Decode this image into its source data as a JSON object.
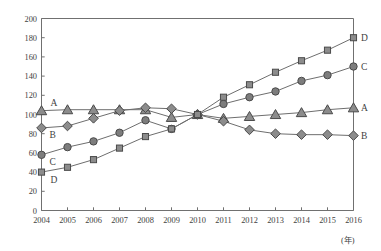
{
  "chart_data": {
    "type": "line",
    "title": "",
    "subtitle": "",
    "xlabel": "(年)",
    "ylabel": "",
    "x": [
      2004,
      2005,
      2006,
      2007,
      2008,
      2009,
      2010,
      2011,
      2012,
      2013,
      2014,
      2015,
      2016
    ],
    "categories": [
      "2004",
      "2005",
      "2006",
      "2007",
      "2008",
      "2009",
      "2010",
      "2011",
      "2012",
      "2013",
      "2014",
      "2015",
      "2016"
    ],
    "xlim": [
      2004,
      2016
    ],
    "ylim": [
      0,
      200
    ],
    "yticks": [
      0,
      20,
      40,
      60,
      80,
      100,
      120,
      140,
      160,
      180,
      200
    ],
    "xticks": [
      "2004",
      "2005",
      "2006",
      "2007",
      "2008",
      "2009",
      "2010",
      "2011",
      "2012",
      "2013",
      "2014",
      "2015",
      "2016"
    ],
    "grid": false,
    "legend_position": "inline-endpoints",
    "series": [
      {
        "name": "A",
        "marker": "triangle",
        "color": "#8c8c8c",
        "line_color": "#6e6e6e",
        "values": [
          104,
          105,
          105,
          105,
          105,
          97,
          100,
          96,
          98,
          100,
          102,
          105,
          107
        ],
        "label_start": "A",
        "label_end": "A"
      },
      {
        "name": "B",
        "marker": "diamond",
        "color": "#8c8c8c",
        "line_color": "#6e6e6e",
        "values": [
          86,
          88,
          96,
          104,
          107,
          106,
          100,
          93,
          84,
          80,
          79,
          79,
          78
        ],
        "label_start": "B",
        "label_end": "B"
      },
      {
        "name": "C",
        "marker": "circle",
        "color": "#7d7d7d",
        "line_color": "#6e6e6e",
        "values": [
          58,
          66,
          72,
          81,
          94,
          85,
          100,
          111,
          118,
          124,
          135,
          141,
          150
        ],
        "label_start": "C",
        "label_end": "C"
      },
      {
        "name": "D",
        "marker": "square",
        "color": "#8c8c8c",
        "line_color": "#6e6e6e",
        "values": [
          40,
          45,
          53,
          65,
          77,
          85,
          100,
          118,
          131,
          144,
          156,
          167,
          180
        ],
        "label_start": "D",
        "label_end": "D"
      }
    ]
  },
  "axis": {
    "y_tick_labels": [
      "200",
      "180",
      "160",
      "140",
      "120",
      "100",
      "80",
      "60",
      "40",
      "20",
      "0"
    ],
    "x_tick_labels": [
      "2004",
      "2005",
      "2006",
      "2007",
      "2008",
      "2009",
      "2010",
      "2011",
      "2012",
      "2013",
      "2014",
      "2015",
      "2016"
    ],
    "x_unit_label": "(年)"
  },
  "series_end_labels": [
    "D",
    "C",
    "A",
    "B"
  ],
  "series_start_labels": [
    "A",
    "B",
    "C",
    "D"
  ],
  "colors": {
    "axis": "#707070",
    "plot_line": "#6e6e6e",
    "marker_fill": "#909090",
    "marker_stroke": "#4a4a4a",
    "text": "#3f3f3f",
    "background": "#ffffff"
  }
}
